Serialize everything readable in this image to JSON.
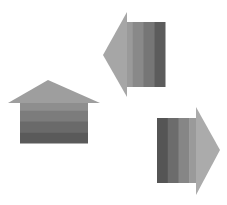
{
  "diagram": {
    "arrows": [
      {
        "id": "left-arrow",
        "direction": "left",
        "head": {
          "tip": [
            103,
            55
          ],
          "base_x": 127,
          "top_y": 12,
          "bottom_y": 97,
          "color": "#a6a6a6"
        },
        "body": {
          "x": 122,
          "y": 22,
          "width": 43,
          "height": 65
        },
        "stripes": [
          "#9a9a9a",
          "#898989",
          "#767676",
          "#5c5c5c"
        ]
      },
      {
        "id": "up-arrow",
        "direction": "up",
        "head": {
          "tip": [
            48,
            80
          ],
          "base_y": 103,
          "left_x": 8,
          "right_x": 100,
          "color": "#9e9e9e"
        },
        "body": {
          "x": 20,
          "y": 100,
          "width": 68,
          "height": 43
        },
        "stripes": [
          "#8e8e8e",
          "#7c7c7c",
          "#6a6a6a",
          "#5a5a5a"
        ]
      },
      {
        "id": "right-arrow",
        "direction": "right",
        "head": {
          "tip": [
            220,
            150
          ],
          "base_x": 196,
          "top_y": 107,
          "bottom_y": 195,
          "color": "#ababab"
        },
        "body": {
          "x": 157,
          "y": 118,
          "width": 43,
          "height": 65
        },
        "stripes": [
          "#555555",
          "#6c6c6c",
          "#868686",
          "#9a9a9a"
        ]
      }
    ]
  }
}
